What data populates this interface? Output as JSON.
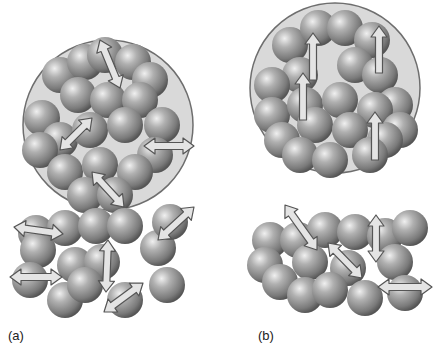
{
  "colors": {
    "background": "#ffffff",
    "sphere_light": "#e6e6e6",
    "sphere_mid": "#9a9a9a",
    "sphere_dark": "#5a5a5a",
    "domain_fill": "#d9d9d9",
    "domain_stroke": "#6e6e6e",
    "arrow_fill": "#e4e4e4",
    "arrow_stroke": "#555555"
  },
  "panels": [
    {
      "id": "a",
      "label": "(a)",
      "label_pos": [
        8,
        340
      ],
      "domain": {
        "cx": 108,
        "cy": 125,
        "r": 85
      },
      "spheres": [
        [
          60,
          75,
          18
        ],
        [
          85,
          62,
          18
        ],
        [
          105,
          55,
          18
        ],
        [
          133,
          62,
          18
        ],
        [
          150,
          80,
          18
        ],
        [
          78,
          95,
          18
        ],
        [
          108,
          100,
          18
        ],
        [
          140,
          100,
          18
        ],
        [
          162,
          125,
          18
        ],
        [
          42,
          118,
          18
        ],
        [
          60,
          140,
          18
        ],
        [
          90,
          130,
          18
        ],
        [
          125,
          125,
          18
        ],
        [
          40,
          150,
          18
        ],
        [
          155,
          155,
          18
        ],
        [
          65,
          172,
          18
        ],
        [
          100,
          165,
          18
        ],
        [
          135,
          172,
          18
        ],
        [
          85,
          195,
          18
        ],
        [
          115,
          195,
          18
        ],
        [
          36,
          233,
          18
        ],
        [
          38,
          250,
          18
        ],
        [
          65,
          228,
          18
        ],
        [
          96,
          226,
          18
        ],
        [
          125,
          226,
          18
        ],
        [
          158,
          248,
          18
        ],
        [
          170,
          222,
          18
        ],
        [
          75,
          265,
          18
        ],
        [
          102,
          262,
          18
        ],
        [
          30,
          280,
          18
        ],
        [
          65,
          300,
          18
        ],
        [
          85,
          285,
          18
        ],
        [
          125,
          300,
          18
        ],
        [
          167,
          285,
          18
        ]
      ],
      "arrows": [
        {
          "x1": 100,
          "y1": 40,
          "x2": 120,
          "y2": 88,
          "double": true
        },
        {
          "x1": 60,
          "y1": 150,
          "x2": 92,
          "y2": 118,
          "double": true
        },
        {
          "x1": 144,
          "y1": 146,
          "x2": 194,
          "y2": 146,
          "double": true
        },
        {
          "x1": 92,
          "y1": 172,
          "x2": 124,
          "y2": 207,
          "double": true
        },
        {
          "x1": 14,
          "y1": 227,
          "x2": 63,
          "y2": 234,
          "double": true
        },
        {
          "x1": 158,
          "y1": 240,
          "x2": 194,
          "y2": 207,
          "double": true
        },
        {
          "x1": 108,
          "y1": 240,
          "x2": 106,
          "y2": 292,
          "double": true
        },
        {
          "x1": 10,
          "y1": 277,
          "x2": 62,
          "y2": 277,
          "double": true
        },
        {
          "x1": 104,
          "y1": 312,
          "x2": 143,
          "y2": 283,
          "double": true
        }
      ]
    },
    {
      "id": "b",
      "label": "(b)",
      "label_pos": [
        258,
        340
      ],
      "domain": {
        "cx": 335,
        "cy": 88,
        "r": 85
      },
      "spheres": [
        [
          290,
          45,
          18
        ],
        [
          318,
          28,
          18
        ],
        [
          345,
          28,
          18
        ],
        [
          372,
          40,
          18
        ],
        [
          300,
          75,
          18
        ],
        [
          355,
          65,
          18
        ],
        [
          380,
          75,
          18
        ],
        [
          272,
          85,
          18
        ],
        [
          395,
          105,
          18
        ],
        [
          272,
          115,
          18
        ],
        [
          305,
          105,
          18
        ],
        [
          340,
          100,
          18
        ],
        [
          375,
          110,
          18
        ],
        [
          400,
          130,
          18
        ],
        [
          282,
          140,
          18
        ],
        [
          315,
          125,
          18
        ],
        [
          350,
          130,
          18
        ],
        [
          385,
          140,
          18
        ],
        [
          300,
          155,
          18
        ],
        [
          330,
          160,
          18
        ],
        [
          370,
          155,
          18
        ],
        [
          270,
          240,
          18
        ],
        [
          265,
          265,
          18
        ],
        [
          298,
          240,
          18
        ],
        [
          325,
          230,
          18
        ],
        [
          355,
          232,
          18
        ],
        [
          385,
          236,
          18
        ],
        [
          410,
          228,
          18
        ],
        [
          310,
          262,
          18
        ],
        [
          348,
          268,
          18
        ],
        [
          395,
          262,
          18
        ],
        [
          280,
          282,
          18
        ],
        [
          305,
          295,
          18
        ],
        [
          330,
          290,
          18
        ],
        [
          365,
          298,
          18
        ],
        [
          405,
          293,
          18
        ]
      ],
      "arrows": [
        {
          "x1": 313,
          "y1": 80,
          "x2": 313,
          "y2": 33,
          "double": false
        },
        {
          "x1": 303,
          "y1": 120,
          "x2": 303,
          "y2": 73,
          "double": false
        },
        {
          "x1": 379,
          "y1": 73,
          "x2": 379,
          "y2": 26,
          "double": false
        },
        {
          "x1": 375,
          "y1": 160,
          "x2": 375,
          "y2": 112,
          "double": false
        },
        {
          "x1": 285,
          "y1": 205,
          "x2": 317,
          "y2": 250,
          "double": true
        },
        {
          "x1": 328,
          "y1": 243,
          "x2": 362,
          "y2": 278,
          "double": true
        },
        {
          "x1": 376,
          "y1": 215,
          "x2": 376,
          "y2": 262,
          "double": true
        },
        {
          "x1": 378,
          "y1": 287,
          "x2": 432,
          "y2": 287,
          "double": true
        }
      ]
    }
  ]
}
